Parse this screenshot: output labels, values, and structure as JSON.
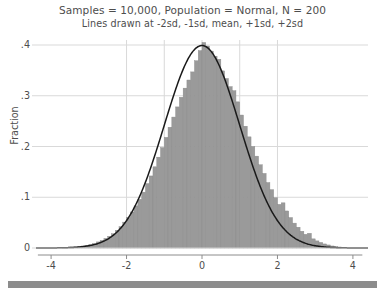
{
  "chart_data": {
    "type": "bar",
    "title": "Samples = 10,000, Population = Normal, N = 200",
    "subtitle": "Lines drawn at -2sd, -1sd, mean, +1sd, +2sd",
    "xlabel": "",
    "ylabel": "Fraction",
    "xlim": [
      -4.4,
      4.4
    ],
    "ylim": [
      0,
      0.44
    ],
    "xticks": [
      -4,
      -2,
      0,
      2,
      4
    ],
    "xtick_labels": [
      "-4",
      "-2",
      "0",
      "2",
      "4"
    ],
    "yticks": [
      0,
      0.1,
      0.2,
      0.3,
      0.4
    ],
    "ytick_labels": [
      "0",
      ".1",
      ".2",
      ".3",
      ".4"
    ],
    "grid": "horizontal",
    "legend": "none",
    "bar_color": "#9a9a9a",
    "bar_edge_color": "#8a8a8a",
    "grid_color": "#d9d9d9",
    "axis_color": "#8c8c8c",
    "curve_color": "#1a1a1a",
    "curve_label": "normal density overlay",
    "reference_lines": [
      {
        "label": "-2sd",
        "x": -2.0
      },
      {
        "label": "-1sd",
        "x": -1.0
      },
      {
        "label": "mean",
        "x": 0.0
      },
      {
        "label": "+1sd",
        "x": 1.0
      },
      {
        "label": "+2sd",
        "x": 2.0
      }
    ],
    "bin_width": 0.1,
    "bin_centers": [
      -3.65,
      -3.55,
      -3.45,
      -3.35,
      -3.25,
      -3.15,
      -3.05,
      -2.95,
      -2.85,
      -2.75,
      -2.65,
      -2.55,
      -2.45,
      -2.35,
      -2.25,
      -2.15,
      -2.05,
      -1.95,
      -1.85,
      -1.75,
      -1.65,
      -1.55,
      -1.45,
      -1.35,
      -1.25,
      -1.15,
      -1.05,
      -0.95,
      -0.85,
      -0.75,
      -0.65,
      -0.55,
      -0.45,
      -0.35,
      -0.25,
      -0.15,
      -0.05,
      0.05,
      0.15,
      0.25,
      0.35,
      0.45,
      0.55,
      0.65,
      0.75,
      0.85,
      0.95,
      1.05,
      1.15,
      1.25,
      1.35,
      1.45,
      1.55,
      1.65,
      1.75,
      1.85,
      1.95,
      2.05,
      2.15,
      2.25,
      2.35,
      2.45,
      2.55,
      2.65,
      2.75,
      2.85,
      2.95,
      3.05,
      3.15,
      3.25,
      3.35,
      3.45,
      3.55,
      3.65
    ],
    "values": [
      0.001,
      0.001,
      0.002,
      0.002,
      0.003,
      0.004,
      0.005,
      0.007,
      0.009,
      0.012,
      0.015,
      0.019,
      0.023,
      0.028,
      0.035,
      0.042,
      0.051,
      0.06,
      0.071,
      0.083,
      0.096,
      0.11,
      0.127,
      0.142,
      0.16,
      0.179,
      0.198,
      0.218,
      0.238,
      0.258,
      0.278,
      0.297,
      0.315,
      0.331,
      0.347,
      0.369,
      0.389,
      0.405,
      0.398,
      0.388,
      0.378,
      0.372,
      0.349,
      0.334,
      0.318,
      0.31,
      0.288,
      0.262,
      0.24,
      0.219,
      0.2,
      0.181,
      0.164,
      0.147,
      0.129,
      0.115,
      0.099,
      0.086,
      0.089,
      0.073,
      0.06,
      0.049,
      0.041,
      0.033,
      0.027,
      0.029,
      0.018,
      0.014,
      0.011,
      0.008,
      0.006,
      0.004,
      0.003,
      0.002
    ],
    "curve_formula": "normal pdf, mean 0, sd 1, peak 0.3989"
  }
}
